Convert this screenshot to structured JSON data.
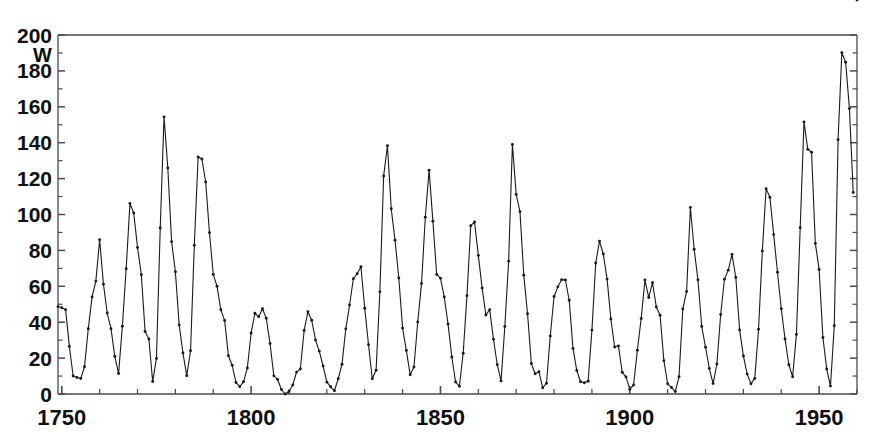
{
  "chart_data": {
    "type": "line",
    "title": "",
    "subtitle": "",
    "xlabel": "",
    "ylabel": "W",
    "ylabel_note": "Wolf sunspot number",
    "xlim": [
      1749,
      1960
    ],
    "ylim": [
      0,
      200
    ],
    "grid": false,
    "legend": "none",
    "markers": true,
    "marker_shape": "dot",
    "line_color": "#1a1a1a",
    "axis_color": "#4a4a4a",
    "background_color": "#ffffff",
    "y_ticks_major": [
      0,
      20,
      40,
      60,
      80,
      100,
      120,
      140,
      160,
      180,
      200
    ],
    "y_tick_labels": [
      "0",
      "20",
      "40",
      "60",
      "80",
      "100",
      "120",
      "140",
      "160",
      "180",
      "200"
    ],
    "y_tick_minor_step": 10,
    "x_ticks_major": [
      1750,
      1800,
      1850,
      1900,
      1950
    ],
    "x_tick_labels": [
      "1750",
      "1800",
      "1850",
      "1900",
      "1950"
    ],
    "x_tick_minor_step": 10,
    "x": [
      1749,
      1750,
      1751,
      1752,
      1753,
      1754,
      1755,
      1756,
      1757,
      1758,
      1759,
      1760,
      1761,
      1762,
      1763,
      1764,
      1765,
      1766,
      1767,
      1768,
      1769,
      1770,
      1771,
      1772,
      1773,
      1774,
      1775,
      1776,
      1777,
      1778,
      1779,
      1780,
      1781,
      1782,
      1783,
      1784,
      1785,
      1786,
      1787,
      1788,
      1789,
      1790,
      1791,
      1792,
      1793,
      1794,
      1795,
      1796,
      1797,
      1798,
      1799,
      1800,
      1801,
      1802,
      1803,
      1804,
      1805,
      1806,
      1807,
      1808,
      1809,
      1810,
      1811,
      1812,
      1813,
      1814,
      1815,
      1816,
      1817,
      1818,
      1819,
      1820,
      1821,
      1822,
      1823,
      1824,
      1825,
      1826,
      1827,
      1828,
      1829,
      1830,
      1831,
      1832,
      1833,
      1834,
      1835,
      1836,
      1837,
      1838,
      1839,
      1840,
      1841,
      1842,
      1843,
      1844,
      1845,
      1846,
      1847,
      1848,
      1849,
      1850,
      1851,
      1852,
      1853,
      1854,
      1855,
      1856,
      1857,
      1858,
      1859,
      1860,
      1861,
      1862,
      1863,
      1864,
      1865,
      1866,
      1867,
      1868,
      1869,
      1870,
      1871,
      1872,
      1873,
      1874,
      1875,
      1876,
      1877,
      1878,
      1879,
      1880,
      1881,
      1882,
      1883,
      1884,
      1885,
      1886,
      1887,
      1888,
      1889,
      1890,
      1891,
      1892,
      1893,
      1894,
      1895,
      1896,
      1897,
      1898,
      1899,
      1900,
      1901,
      1902,
      1903,
      1904,
      1905,
      1906,
      1907,
      1908,
      1909,
      1910,
      1911,
      1912,
      1913,
      1914,
      1915,
      1916,
      1917,
      1918,
      1919,
      1920,
      1921,
      1922,
      1923,
      1924,
      1925,
      1926,
      1927,
      1928,
      1929,
      1930,
      1931,
      1932,
      1933,
      1934,
      1935,
      1936,
      1937,
      1938,
      1939,
      1940,
      1941,
      1942,
      1943,
      1944,
      1945,
      1946,
      1947,
      1948,
      1949,
      1950,
      1951,
      1952,
      1953,
      1954,
      1955,
      1956,
      1957,
      1958,
      1959,
      1960
    ],
    "y": [
      48.7,
      48.1,
      47.0,
      26.5,
      10.0,
      9.2,
      8.6,
      15.2,
      36.4,
      54.1,
      62.9,
      85.9,
      61.2,
      45.1,
      36.4,
      20.9,
      11.4,
      37.8,
      69.8,
      106.1,
      100.8,
      81.6,
      66.5,
      34.8,
      30.6,
      7.0,
      19.8,
      92.5,
      154.4,
      125.9,
      84.8,
      68.1,
      38.5,
      22.8,
      10.2,
      24.1,
      82.9,
      132.0,
      130.9,
      118.1,
      89.9,
      66.6,
      60.0,
      46.9,
      41.0,
      21.3,
      16.0,
      6.4,
      4.1,
      6.8,
      14.5,
      34.0,
      45.0,
      43.1,
      47.5,
      42.2,
      28.1,
      10.1,
      8.1,
      2.5,
      0.0,
      1.4,
      5.0,
      12.2,
      13.9,
      35.4,
      45.8,
      41.1,
      30.1,
      23.9,
      15.6,
      6.6,
      4.0,
      1.8,
      8.5,
      16.6,
      36.3,
      49.6,
      64.2,
      67.0,
      70.9,
      47.8,
      27.5,
      8.5,
      13.2,
      56.9,
      121.5,
      138.3,
      103.2,
      85.7,
      64.6,
      36.7,
      24.2,
      10.7,
      15.0,
      40.1,
      61.5,
      98.5,
      124.7,
      96.3,
      66.6,
      64.5,
      54.1,
      39.0,
      20.6,
      6.7,
      4.3,
      22.7,
      54.8,
      93.8,
      95.8,
      77.2,
      59.1,
      44.0,
      47.0,
      30.5,
      16.3,
      7.3,
      37.6,
      74.0,
      139.0,
      111.2,
      101.6,
      66.2,
      44.7,
      17.0,
      11.3,
      12.4,
      3.4,
      6.0,
      32.3,
      54.3,
      59.7,
      63.7,
      63.5,
      52.2,
      25.4,
      13.1,
      6.8,
      6.3,
      7.1,
      35.6,
      73.0,
      85.1,
      78.0,
      64.0,
      41.8,
      26.2,
      26.7,
      12.1,
      9.5,
      2.7,
      5.0,
      24.4,
      42.0,
      63.5,
      53.8,
      62.0,
      48.5,
      43.9,
      18.6,
      5.7,
      3.6,
      1.4,
      9.6,
      47.4,
      57.1,
      103.9,
      80.6,
      63.6,
      37.6,
      26.1,
      14.2,
      5.8,
      16.7,
      44.3,
      63.9,
      69.0,
      77.8,
      64.9,
      35.7,
      21.2,
      11.1,
      5.7,
      8.7,
      36.1,
      79.7,
      114.4,
      109.6,
      88.8,
      67.8,
      47.5,
      30.6,
      16.3,
      9.6,
      33.2,
      92.6,
      151.6,
      136.3,
      134.7,
      83.9,
      69.4,
      31.5,
      13.9,
      4.4,
      38.0,
      141.7,
      190.2,
      184.8,
      159.0,
      112.3
    ]
  }
}
